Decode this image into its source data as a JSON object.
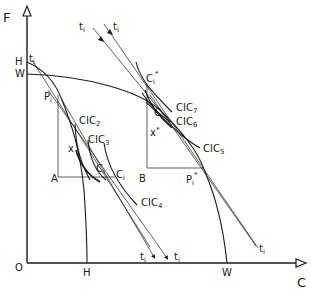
{
  "diagram": {
    "axes": {
      "y_label": "F",
      "x_label": "C",
      "origin_label": "O"
    },
    "axis_points": {
      "y_H": "H",
      "y_W": "W",
      "x_H": "H",
      "x_W": "W"
    },
    "points": {
      "P_i": "P",
      "P_i_sub": "i",
      "P_star": "P",
      "P_star_sub": "i",
      "P_star_sup": "*",
      "A": "A",
      "B": "B",
      "x": "x",
      "x_star": "x",
      "x_star_sup": "*",
      "C_i": "C",
      "C_i_sub": "i",
      "C_i_prime": "C",
      "C_i_prime_sub": "i",
      "C_i_prime_sup": "′",
      "C_i_star": "C",
      "C_i_star_sub": "i",
      "C_i_star_sup": "*",
      "C_i_prime_star": "C",
      "C_i_prime_star_sub": "i",
      "C_i_prime_star_sup": "′*"
    },
    "curve_labels": {
      "cic2": "CIC",
      "cic2_sub": "2",
      "cic3": "CIC",
      "cic3_sub": "3",
      "cic4": "CIC",
      "cic4_sub": "4",
      "cic5": "CIC",
      "cic5_sub": "5",
      "cic6": "CIC",
      "cic6_sub": "6",
      "cic7": "CIC",
      "cic7_sub": "7"
    },
    "price_lines": {
      "t": "t",
      "sub": "i"
    }
  }
}
